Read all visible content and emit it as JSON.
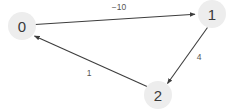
{
  "graph": {
    "type": "directed-weighted-graph",
    "background_color": "#ffffff",
    "node_fill_color": "#ededed",
    "node_label_color": "#3a3a3a",
    "edge_color": "#3d3d3d",
    "edge_label_color": "#555555",
    "nodes": [
      {
        "id": "0",
        "label": "0",
        "cx": 22,
        "cy": 26,
        "r": 14
      },
      {
        "id": "1",
        "label": "1",
        "cx": 212,
        "cy": 14,
        "r": 14
      },
      {
        "id": "2",
        "label": "2",
        "cx": 158,
        "cy": 95,
        "r": 14
      }
    ],
    "edges": [
      {
        "from": "0",
        "to": "1",
        "weight": "−10",
        "label_x": 119,
        "label_y": 7
      },
      {
        "from": "1",
        "to": "2",
        "weight": "4",
        "label_x": 199,
        "label_y": 57
      },
      {
        "from": "2",
        "to": "0",
        "weight": "1",
        "label_x": 89,
        "label_y": 73
      }
    ]
  }
}
